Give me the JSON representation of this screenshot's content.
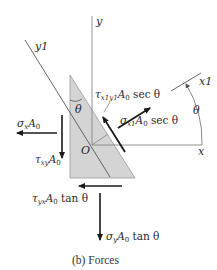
{
  "figure": {
    "caption": "(b) Forces",
    "colors": {
      "element_fill": "#d4d4d4",
      "element_stroke": "#999999",
      "axis": "#888888",
      "arrow": "#1a1a1a",
      "text": "#2a2a2a"
    },
    "axes": {
      "x": "x",
      "y": "y",
      "x1": "x1",
      "y1": "y1",
      "origin": "O"
    },
    "angles": {
      "theta_element": "θ",
      "theta_axes": "θ"
    },
    "forces": {
      "sigma_x": {
        "sym": "σ",
        "sub": "x",
        "rest": "A",
        "rest_sub": "0",
        "tail": ""
      },
      "tau_xy": {
        "sym": "τ",
        "sub": "xy",
        "rest": "A",
        "rest_sub": "0",
        "tail": ""
      },
      "tau_yx": {
        "sym": "τ",
        "sub": "yx",
        "rest": "A",
        "rest_sub": "0",
        "tail": " tan θ"
      },
      "sigma_y": {
        "sym": "σ",
        "sub": "y",
        "rest": "A",
        "rest_sub": "0",
        "tail": " tan θ"
      },
      "sigma_x1": {
        "sym": "σ",
        "sub": "x1",
        "rest": "A",
        "rest_sub": "0",
        "tail": " sec θ"
      },
      "tau_x1y1": {
        "sym": "τ",
        "sub": "x1y1",
        "rest": "A",
        "rest_sub": "0",
        "tail": " sec θ"
      }
    }
  }
}
